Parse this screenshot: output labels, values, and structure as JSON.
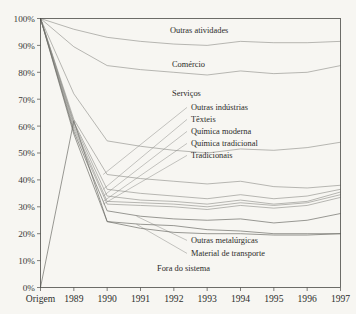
{
  "chart_data": {
    "type": "line",
    "title": "",
    "xlabel": "",
    "ylabel": "",
    "x": [
      "Origem",
      "1989",
      "1990",
      "1991",
      "1992",
      "1993",
      "1994",
      "1995",
      "1996",
      "1997"
    ],
    "xtick_labels": [
      "Origem",
      "1989",
      "1990",
      "1991",
      "1992",
      "1993",
      "1994",
      "1995",
      "1996",
      "1997"
    ],
    "ytick_labels": [
      "0%",
      "10%",
      "20%",
      "30%",
      "40%",
      "50%",
      "60%",
      "70%",
      "80%",
      "90%",
      "100%"
    ],
    "ytick_values": [
      0,
      10,
      20,
      30,
      40,
      50,
      60,
      70,
      80,
      90,
      100
    ],
    "ylim": [
      0,
      100
    ],
    "grid": false,
    "legend": "inline-labels",
    "value_unit": "%",
    "series": [
      {
        "name": "Outras atividades",
        "values": [
          100,
          96,
          93,
          91.5,
          90.5,
          90,
          91.5,
          91,
          91,
          91.5
        ]
      },
      {
        "name": "Comércio",
        "values": [
          100,
          89.5,
          82.5,
          81,
          80,
          79,
          80.5,
          79.5,
          80,
          82.5
        ]
      },
      {
        "name": "Serviços",
        "values": [
          100,
          72,
          54.5,
          52.5,
          51,
          50,
          51.5,
          51,
          52,
          54
        ]
      },
      {
        "name": "Outras indústrias",
        "values": [
          100,
          62.5,
          42,
          40.5,
          39.5,
          38.5,
          39.5,
          37.5,
          37,
          38
        ]
      },
      {
        "name": "Têxteis",
        "values": [
          100,
          61.5,
          36.5,
          35,
          34,
          33,
          34.5,
          33,
          34,
          36.5
        ]
      },
      {
        "name": "Química moderna",
        "values": [
          100,
          61,
          34,
          32.5,
          32,
          31,
          32.5,
          31,
          32,
          35.5
        ]
      },
      {
        "name": "Química tradicional",
        "values": [
          100,
          60,
          32,
          31.5,
          31,
          30,
          31.5,
          30.5,
          31.5,
          34.5
        ]
      },
      {
        "name": "Tradicionais",
        "values": [
          100,
          59,
          31,
          30.5,
          30,
          29,
          30.5,
          29.5,
          30.5,
          33.5
        ]
      },
      {
        "name": "Outras metalúrgicas",
        "values": [
          100,
          58,
          28.5,
          26.5,
          25.5,
          25,
          25.5,
          24,
          25,
          27.5
        ]
      },
      {
        "name": "Material de transporte",
        "values": [
          100,
          57,
          24.5,
          23.5,
          23,
          21.5,
          21,
          20,
          20,
          20
        ]
      },
      {
        "name": "Fora do sistema",
        "values": [
          0,
          62,
          24.5,
          22,
          20.5,
          20,
          20,
          19.5,
          19.5,
          20
        ]
      }
    ],
    "label_annotations": [
      {
        "name": "Outras atividades",
        "text": "Outras atividades",
        "x": 170,
        "y": 33
      },
      {
        "name": "Comércio",
        "text": "Comércio",
        "x": 172,
        "y": 67
      },
      {
        "name": "Serviços",
        "text": "Serviços",
        "x": 172,
        "y": 96
      },
      {
        "name": "Outras indústrias",
        "text": "Outras indústrias",
        "x": 191,
        "y": 110
      },
      {
        "name": "Têxteis",
        "text": "Têxteis",
        "x": 191,
        "y": 122
      },
      {
        "name": "Química moderna",
        "text": "Química moderna",
        "x": 191,
        "y": 134
      },
      {
        "name": "Química tradicional",
        "text": "Química tradicional",
        "x": 191,
        "y": 146
      },
      {
        "name": "Tradicionais",
        "text": "Tradicionais",
        "x": 191,
        "y": 158
      },
      {
        "name": "Outras metalúrgicas",
        "text": "Outras metalúrgicas",
        "x": 191,
        "y": 243
      },
      {
        "name": "Material de transporte",
        "text": "Material de transporte",
        "x": 191,
        "y": 256
      },
      {
        "name": "Fora do sistema",
        "text": "Fora do sistema",
        "x": 157,
        "y": 271
      }
    ],
    "colors": {
      "background": "#f7f6f2",
      "line": "#8d8d88",
      "axis": "#4a4a46",
      "text": "#2b2b29"
    }
  }
}
